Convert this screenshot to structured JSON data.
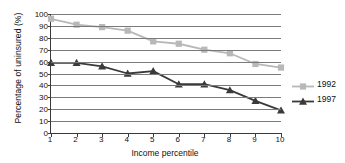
{
  "chart_data": {
    "type": "line",
    "title": "",
    "xlabel": "Income percentile",
    "ylabel": "Percentage of uninsured (%)",
    "categories": [
      1,
      2,
      3,
      4,
      5,
      6,
      7,
      8,
      9,
      10
    ],
    "xtick_labels": [
      "1",
      "2",
      "3",
      "4",
      "5",
      "6",
      "7",
      "8",
      "9",
      "10"
    ],
    "ytick_labels": [
      "0",
      "10",
      "20",
      "30",
      "40",
      "50",
      "60",
      "70",
      "80",
      "90",
      "100"
    ],
    "yticks": [
      0,
      10,
      20,
      30,
      40,
      50,
      60,
      70,
      80,
      90,
      100
    ],
    "ylim": [
      0,
      100
    ],
    "xlim": [
      1,
      10
    ],
    "grid": "horizontal",
    "legend_position": "right",
    "series": [
      {
        "name": "1992",
        "color": "#b8b8b8",
        "marker": "square",
        "values": [
          96,
          91,
          89,
          86,
          77,
          75,
          70,
          67,
          58,
          55
        ]
      },
      {
        "name": "1997",
        "color": "#3a3a3a",
        "marker": "triangle",
        "values": [
          59,
          59,
          56,
          50,
          52,
          41,
          41,
          36,
          27,
          19
        ]
      }
    ]
  },
  "legend": {
    "items": [
      {
        "label": "1992",
        "color": "#b8b8b8",
        "marker": "square"
      },
      {
        "label": "1997",
        "color": "#3a3a3a",
        "marker": "triangle"
      }
    ]
  },
  "colors": {
    "series_1992": "#b8b8b8",
    "series_1997": "#3a3a3a",
    "gridline": "#7a7a7a",
    "axis": "#3a3a3a",
    "background": "#ffffff",
    "text": "#111111"
  }
}
